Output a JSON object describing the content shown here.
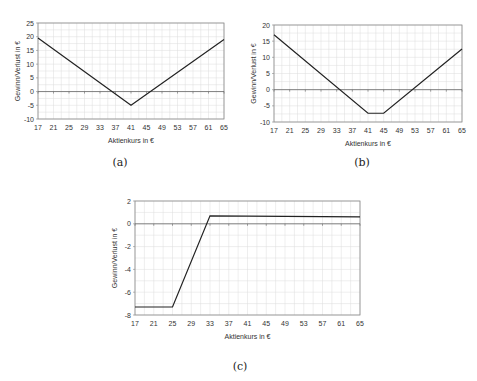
{
  "chart_data": [
    {
      "id": "a",
      "type": "line",
      "title": "",
      "caption": "(a)",
      "xlabel": "Aktienkurs in €",
      "ylabel": "Gewinn/Verlust in €",
      "x_ticks": [
        17,
        21,
        25,
        29,
        33,
        37,
        41,
        45,
        49,
        53,
        57,
        61,
        65
      ],
      "y_ticks": [
        25,
        20,
        15,
        10,
        5,
        0,
        -5,
        -10
      ],
      "xlim": [
        17,
        65
      ],
      "ylim": [
        -10,
        25
      ],
      "grid": true,
      "legend": "none",
      "series": [
        {
          "name": "Gewinn/Verlust",
          "x": [
            17,
            41,
            65
          ],
          "y": [
            19.5,
            -5,
            19
          ]
        }
      ]
    },
    {
      "id": "b",
      "type": "line",
      "title": "",
      "caption": "(b)",
      "xlabel": "Aktienkurs in €",
      "ylabel": "Gewinn/Verlust in €",
      "x_ticks": [
        17,
        21,
        25,
        29,
        33,
        37,
        41,
        45,
        49,
        53,
        57,
        61,
        65
      ],
      "y_ticks": [
        20,
        15,
        10,
        5,
        0,
        -5,
        -10
      ],
      "xlim": [
        17,
        65
      ],
      "ylim": [
        -10,
        20
      ],
      "grid": true,
      "legend": "none",
      "series": [
        {
          "name": "Gewinn/Verlust",
          "x": [
            17,
            41,
            45,
            65
          ],
          "y": [
            17,
            -7.3,
            -7.3,
            12.6
          ]
        }
      ]
    },
    {
      "id": "c",
      "type": "line",
      "title": "",
      "caption": "(c)",
      "xlabel": "Aktienkurs in €",
      "ylabel": "Gewinn/Verlust in €",
      "x_ticks": [
        17,
        21,
        25,
        29,
        33,
        37,
        41,
        45,
        49,
        53,
        57,
        61,
        65
      ],
      "y_ticks": [
        2,
        0,
        -2,
        -4,
        -6,
        -8
      ],
      "xlim": [
        17,
        65
      ],
      "ylim": [
        -8,
        2
      ],
      "grid": true,
      "legend": "none",
      "series": [
        {
          "name": "Gewinn/Verlust",
          "x": [
            17,
            25,
            33,
            65
          ],
          "y": [
            -7.3,
            -7.3,
            0.7,
            0.6
          ]
        }
      ]
    }
  ],
  "layout": [
    {
      "left": 38,
      "top": 23,
      "width": 186,
      "height": 96,
      "caption_x": 120,
      "caption_y": 156
    },
    {
      "left": 274,
      "top": 25,
      "width": 188,
      "height": 97,
      "caption_x": 362,
      "caption_y": 156
    },
    {
      "left": 135,
      "top": 201,
      "width": 225,
      "height": 114,
      "caption_x": 240,
      "caption_y": 360
    }
  ],
  "colors": {
    "line": "#222222",
    "grid": "#dcdcdc",
    "axis": "#888888",
    "zero": "#666666"
  }
}
